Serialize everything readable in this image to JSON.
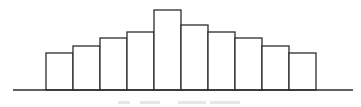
{
  "chart_data": {
    "type": "bar",
    "title": "",
    "xlabel": "",
    "ylabel": "",
    "categories": [
      "1",
      "2",
      "3",
      "4",
      "5",
      "6",
      "7",
      "8",
      "9",
      "10"
    ],
    "values": [
      37,
      44,
      52,
      58,
      80,
      65,
      58,
      52,
      44,
      37
    ],
    "ylim": [
      0,
      85
    ],
    "grid": false,
    "legend": null,
    "layout": {
      "baseline_y": 90,
      "first_bar_x": 46,
      "bar_width": 27,
      "axis_x_start": 13,
      "axis_x_end": 353,
      "stroke_color": "#2b2b2b",
      "fill_color": "#ffffff"
    }
  }
}
